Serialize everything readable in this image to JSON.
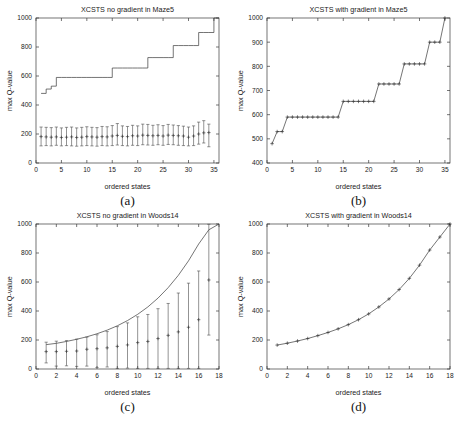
{
  "figure": {
    "panels": [
      {
        "key": "a",
        "caption": "(a)",
        "chart_data": {
          "type": "line",
          "title": "XCSTS no gradient in Maze5",
          "xlabel": "ordered states",
          "ylabel": "max Q-value",
          "xlim": [
            0,
            36
          ],
          "ylim": [
            0,
            1000
          ],
          "xticks": [
            0,
            5,
            10,
            15,
            20,
            25,
            30,
            35
          ],
          "yticks": [
            0,
            200,
            400,
            600,
            800,
            1000
          ],
          "grid": false,
          "legend": "none",
          "series": [
            {
              "name": "optimal step function",
              "style": "step-line",
              "x": [
                1,
                2,
                3,
                4,
                5,
                6,
                7,
                8,
                9,
                10,
                11,
                12,
                13,
                14,
                15,
                16,
                17,
                18,
                19,
                20,
                21,
                22,
                23,
                24,
                25,
                26,
                27,
                28,
                29,
                30,
                31,
                32,
                33,
                34,
                35,
                36
              ],
              "values": [
                480,
                510,
                530,
                590,
                590,
                590,
                590,
                590,
                590,
                590,
                590,
                590,
                590,
                590,
                655,
                655,
                655,
                655,
                655,
                655,
                655,
                727,
                727,
                727,
                727,
                727,
                810,
                810,
                810,
                810,
                810,
                900,
                900,
                900,
                1000,
                1000
              ]
            },
            {
              "name": "measured mean with error bars",
              "style": "errorbar",
              "x": [
                1,
                2,
                3,
                4,
                5,
                6,
                7,
                8,
                9,
                10,
                11,
                12,
                13,
                14,
                15,
                16,
                17,
                18,
                19,
                20,
                21,
                22,
                23,
                24,
                25,
                26,
                27,
                28,
                29,
                30,
                31,
                32,
                33,
                34
              ],
              "values": [
                182,
                180,
                178,
                180,
                176,
                178,
                180,
                176,
                178,
                182,
                180,
                178,
                182,
                180,
                186,
                190,
                184,
                182,
                188,
                186,
                192,
                190,
                188,
                190,
                186,
                192,
                190,
                188,
                186,
                178,
                186,
                200,
                208,
                210
              ],
              "err_low": [
                118,
                120,
                118,
                122,
                118,
                120,
                118,
                116,
                118,
                120,
                118,
                116,
                120,
                118,
                120,
                124,
                120,
                118,
                122,
                120,
                126,
                124,
                122,
                126,
                122,
                128,
                126,
                122,
                120,
                118,
                120,
                130,
                138,
                112
              ],
              "err_high": [
                248,
                246,
                244,
                248,
                242,
                246,
                248,
                242,
                246,
                250,
                246,
                244,
                252,
                250,
                258,
                272,
                256,
                252,
                260,
                256,
                268,
                266,
                260,
                264,
                258,
                266,
                262,
                258,
                254,
                248,
                256,
                282,
                292,
                268
              ]
            }
          ]
        }
      },
      {
        "key": "b",
        "caption": "(b)",
        "chart_data": {
          "type": "line",
          "title": "XCSTS with gradient in Maze5",
          "xlabel": "ordered states",
          "ylabel": "max Q-value",
          "xlim": [
            0,
            36
          ],
          "ylim": [
            400,
            1000
          ],
          "xticks": [
            0,
            5,
            10,
            15,
            20,
            25,
            30,
            35
          ],
          "yticks": [
            400,
            500,
            600,
            700,
            800,
            900,
            1000
          ],
          "grid": false,
          "legend": "none",
          "series": [
            {
              "name": "measured step function",
              "style": "line-markers",
              "x": [
                1,
                2,
                3,
                4,
                5,
                6,
                7,
                8,
                9,
                10,
                11,
                12,
                13,
                14,
                15,
                16,
                17,
                18,
                19,
                20,
                21,
                22,
                23,
                24,
                25,
                26,
                27,
                28,
                29,
                30,
                31,
                32,
                33,
                34,
                35
              ],
              "values": [
                480,
                530,
                530,
                590,
                590,
                590,
                590,
                590,
                590,
                590,
                590,
                590,
                590,
                590,
                655,
                655,
                655,
                655,
                655,
                655,
                655,
                727,
                727,
                727,
                727,
                727,
                810,
                810,
                810,
                810,
                810,
                900,
                900,
                900,
                1000
              ]
            }
          ]
        }
      },
      {
        "key": "c",
        "caption": "(c)",
        "chart_data": {
          "type": "line",
          "title": "XCSTS no gradient in Woods14",
          "xlabel": "ordered states",
          "ylabel": "max Q-value",
          "xlim": [
            0,
            18
          ],
          "ylim": [
            0,
            1000
          ],
          "xticks": [
            0,
            2,
            4,
            6,
            8,
            10,
            12,
            14,
            16,
            18
          ],
          "yticks": [
            0,
            200,
            400,
            600,
            800,
            1000
          ],
          "grid": false,
          "legend": "none",
          "series": [
            {
              "name": "optimal exponential curve",
              "style": "smooth-line",
              "x": [
                1,
                2,
                3,
                4,
                5,
                6,
                7,
                8,
                9,
                10,
                11,
                12,
                13,
                14,
                15,
                16,
                17,
                18
              ],
              "values": [
                168,
                177,
                190,
                205,
                222,
                243,
                268,
                298,
                334,
                377,
                428,
                489,
                561,
                646,
                746,
                862,
                960,
                1000
              ]
            },
            {
              "name": "measured mean with error bars",
              "style": "errorbar",
              "x": [
                1,
                2,
                3,
                4,
                5,
                6,
                7,
                8,
                9,
                10,
                11,
                12,
                13,
                14,
                15,
                16,
                17
              ],
              "values": [
                120,
                120,
                122,
                124,
                136,
                140,
                146,
                156,
                166,
                182,
                190,
                210,
                232,
                256,
                288,
                340,
                614
              ],
              "err_low": [
                42,
                20,
                22,
                18,
                20,
                10,
                14,
                4,
                6,
                4,
                4,
                4,
                4,
                4,
                4,
                4,
                234
              ],
              "err_high": [
                185,
                192,
                196,
                206,
                220,
                236,
                258,
                292,
                318,
                360,
                376,
                416,
                452,
                524,
                592,
                676,
                998
              ]
            }
          ]
        }
      },
      {
        "key": "d",
        "caption": "(d)",
        "chart_data": {
          "type": "line",
          "title": "XCSTS with gradient in Woods14",
          "xlabel": "ordered states",
          "ylabel": "max Q-value",
          "xlim": [
            0,
            18
          ],
          "ylim": [
            0,
            1000
          ],
          "xticks": [
            0,
            2,
            4,
            6,
            8,
            10,
            12,
            14,
            16,
            18
          ],
          "yticks": [
            0,
            200,
            400,
            600,
            800,
            1000
          ],
          "grid": false,
          "legend": "none",
          "series": [
            {
              "name": "measured exponential curve",
              "style": "smooth-line-markers",
              "x": [
                1,
                2,
                3,
                4,
                5,
                6,
                7,
                8,
                9,
                10,
                11,
                12,
                13,
                14,
                15,
                16,
                17,
                18
              ],
              "values": [
                165,
                178,
                193,
                210,
                230,
                252,
                277,
                306,
                340,
                380,
                428,
                483,
                548,
                625,
                716,
                820,
                910,
                1000
              ]
            }
          ]
        }
      }
    ]
  }
}
